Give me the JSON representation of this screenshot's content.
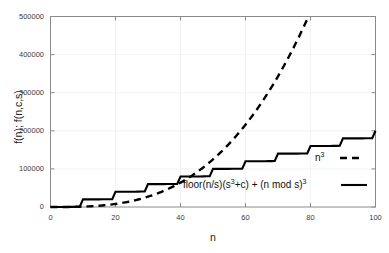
{
  "chart_data": {
    "type": "line",
    "title": "",
    "xlabel": "n",
    "ylabel": "f(n); f(n,c,s)",
    "xlim": [
      0,
      100
    ],
    "ylim": [
      0,
      500000
    ],
    "xticks": [
      "0",
      "20",
      "40",
      "60",
      "80",
      "100"
    ],
    "xtick_values": [
      0,
      20,
      40,
      60,
      80,
      100
    ],
    "yticks": [
      "0",
      "100000",
      "200000",
      "300000",
      "400000",
      "500000"
    ],
    "ytick_values": [
      0,
      100000,
      200000,
      300000,
      400000,
      500000
    ],
    "grid": true,
    "legend_position": "inside-right",
    "series": [
      {
        "name": "n^3",
        "legend_label": "n³",
        "style": "dashed",
        "color": "#000000",
        "formula": "n^3",
        "x": [
          0,
          5,
          10,
          15,
          20,
          25,
          30,
          35,
          40,
          45,
          50,
          55,
          60,
          65,
          70,
          75,
          79.37
        ],
        "values": [
          0,
          125,
          1000,
          3375,
          8000,
          15625,
          27000,
          42875,
          64000,
          91125,
          125000,
          166375,
          216000,
          274625,
          343000,
          421875,
          500000
        ]
      },
      {
        "name": "floor(n/s)(s^3+c) + (n mod s)^3",
        "legend_label": "floor(n/s)(s³+c) + (n mod s)³",
        "style": "solid",
        "color": "#000000",
        "formula": "floor(n/s)*(s^3+c) + (n mod s)^3",
        "params": {
          "s": 10,
          "c": 19000
        },
        "block_size": 10,
        "block_increment": 20000,
        "x": [
          0,
          10,
          20,
          30,
          40,
          50,
          60,
          70,
          80,
          90,
          100
        ],
        "values": [
          0,
          20000,
          40000,
          60000,
          80000,
          100000,
          120000,
          140000,
          160000,
          180000,
          200000
        ]
      }
    ]
  },
  "legend": {
    "entries": [
      {
        "label_html": "n<sup>3</sup>",
        "dash": "dashed"
      },
      {
        "label_html": "floor(n/s)(s<sup>3</sup>+c) + (n mod s)<sup>3</sup>",
        "dash": "solid"
      }
    ]
  }
}
